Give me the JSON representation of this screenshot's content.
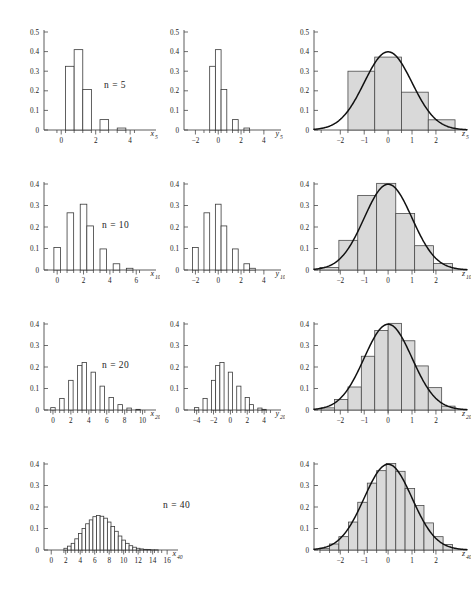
{
  "figure": {
    "title": "",
    "background": "#ffffff",
    "bar_fill_open": "#ffffff",
    "bar_fill_shaded": "#d9d9d9",
    "bar_stroke": "#3a3a3a",
    "axis_color": "#4a4a4a",
    "curve_color": "#111111"
  },
  "rows": [
    {
      "n_label_prefix": "n",
      "n_label_eq": "=",
      "n_label_value": "5"
    },
    {
      "n_label_prefix": "n",
      "n_label_eq": "=",
      "n_label_value": "10"
    },
    {
      "n_label_prefix": "n",
      "n_label_eq": "=",
      "n_label_value": "20"
    },
    {
      "n_label_prefix": "n",
      "n_label_eq": "=",
      "n_label_value": "40"
    }
  ],
  "chart_data": [
    {
      "type": "bar",
      "id": "x5",
      "row": 1,
      "column": 1,
      "title": "",
      "xlabel": "x",
      "xlabel_sub": "5",
      "ylabel": "",
      "xlim": [
        -1,
        5.5
      ],
      "ylim": [
        0,
        0.5
      ],
      "bin_width": 0.5,
      "grid": false,
      "legend": null,
      "yticks": [
        0,
        0.1,
        0.2,
        0.3,
        0.4,
        0.5
      ],
      "ytick_labels": [
        "0",
        "0.1",
        "0.2",
        "0.3",
        "0.4",
        "0.5"
      ],
      "xticks": [
        0,
        2,
        4
      ],
      "xtick_labels": [
        "0",
        "2",
        "4"
      ],
      "xtick_minor": [
        -0.5,
        0,
        0.5,
        1,
        1.5,
        2,
        2.5,
        3,
        3.5,
        4,
        4.5
      ],
      "bin_edges": [
        -0.25,
        0.25,
        0.75,
        1.25,
        1.75,
        2.25,
        2.75,
        3.25,
        3.75,
        4.25
      ],
      "values": [
        0.0,
        0.325,
        0.41,
        0.207,
        0.0,
        0.053,
        0.0,
        0.01,
        0.0
      ]
    },
    {
      "type": "bar",
      "id": "y5",
      "row": 1,
      "column": 2,
      "title": "",
      "xlabel": "y",
      "xlabel_sub": "5",
      "ylabel": "",
      "xlim": [
        -3,
        5.5
      ],
      "ylim": [
        0,
        0.5
      ],
      "bin_width": 0.5,
      "grid": false,
      "legend": null,
      "yticks": [
        0,
        0.1,
        0.2,
        0.3,
        0.4,
        0.5
      ],
      "ytick_labels": [
        "0",
        "0.1",
        "0.2",
        "0.3",
        "0.4",
        "0.5"
      ],
      "xticks": [
        -2,
        0,
        2,
        4
      ],
      "xtick_labels": [
        "−2",
        "0",
        "2",
        "4"
      ],
      "xtick_minor": [
        -1.5,
        -1,
        -0.5,
        0,
        0.5,
        1,
        1.5,
        2,
        2.5
      ],
      "bin_edges": [
        -1.25,
        -0.75,
        -0.25,
        0.25,
        0.75,
        1.25,
        1.75,
        2.25,
        2.75
      ],
      "values": [
        0.0,
        0.325,
        0.41,
        0.207,
        0.0,
        0.053,
        0.0,
        0.01
      ]
    },
    {
      "type": "bar",
      "id": "z5",
      "row": 1,
      "column": 3,
      "title": "",
      "xlabel": "z",
      "xlabel_sub": "5",
      "ylabel": "",
      "xlim": [
        -3.1,
        3.3
      ],
      "ylim": [
        0,
        0.5
      ],
      "bin_width": 1.118,
      "grid": false,
      "legend": null,
      "yticks": [
        0,
        0.1,
        0.2,
        0.3,
        0.4,
        0.5
      ],
      "ytick_labels": [
        "0",
        "0.1",
        "0.2",
        "0.3",
        "0.4",
        "0.5"
      ],
      "xticks": [
        -2,
        -1,
        0,
        1,
        2
      ],
      "xtick_labels": [
        "−2",
        "−1",
        "0",
        "1",
        "2"
      ],
      "bin_edges": [
        -2.8,
        -1.68,
        -0.56,
        0.56,
        1.68,
        2.8
      ],
      "values": [
        0.0,
        0.3,
        0.372,
        0.193,
        0.052
      ],
      "overlay_curve": {
        "name": "standard normal density",
        "formula": "phi(z) = exp(-z^2/2)/sqrt(2*pi)",
        "mean": 0,
        "sd": 1,
        "peak": 0.399
      }
    },
    {
      "type": "bar",
      "id": "x10",
      "row": 2,
      "column": 1,
      "title": "",
      "xlabel": "x",
      "xlabel_sub": "10",
      "ylabel": "",
      "xlim": [
        -1,
        7.5
      ],
      "ylim": [
        0,
        0.4
      ],
      "bin_width": 0.5,
      "grid": false,
      "legend": null,
      "yticks": [
        0,
        0.1,
        0.2,
        0.3,
        0.4
      ],
      "ytick_labels": [
        "0",
        "0.1",
        "0.2",
        "0.3",
        "0.4"
      ],
      "xticks": [
        0,
        2,
        4,
        6
      ],
      "xtick_labels": [
        "0",
        "2",
        "4",
        "6"
      ],
      "bin_edges": [
        -0.25,
        0.25,
        0.75,
        1.25,
        1.75,
        2.25,
        2.75,
        3.25,
        3.75,
        4.25,
        4.75,
        5.25,
        5.75,
        6.25
      ],
      "values": [
        0.105,
        0.0,
        0.266,
        0.0,
        0.306,
        0.205,
        0.0,
        0.098,
        0.0,
        0.029,
        0.0,
        0.008,
        0.0
      ]
    },
    {
      "type": "bar",
      "id": "y10",
      "row": 2,
      "column": 2,
      "title": "",
      "xlabel": "y",
      "xlabel_sub": "10",
      "ylabel": "",
      "xlim": [
        -3,
        5.5
      ],
      "ylim": [
        0,
        0.4
      ],
      "bin_width": 0.5,
      "grid": false,
      "legend": null,
      "yticks": [
        0,
        0.1,
        0.2,
        0.3,
        0.4
      ],
      "ytick_labels": [
        "0",
        "0.1",
        "0.2",
        "0.3",
        "0.4"
      ],
      "xticks": [
        -2,
        0,
        2,
        4
      ],
      "xtick_labels": [
        "−2",
        "0",
        "2",
        "4"
      ],
      "bin_edges": [
        -2.25,
        -1.75,
        -1.25,
        -0.75,
        -0.25,
        0.25,
        0.75,
        1.25,
        1.75,
        2.25,
        2.75,
        3.25
      ],
      "values": [
        0.105,
        0.0,
        0.266,
        0.0,
        0.306,
        0.205,
        0.0,
        0.098,
        0.0,
        0.029,
        0.008
      ]
    },
    {
      "type": "bar",
      "id": "z10",
      "row": 2,
      "column": 3,
      "title": "",
      "xlabel": "z",
      "xlabel_sub": "10",
      "ylabel": "",
      "xlim": [
        -3.1,
        3.3
      ],
      "ylim": [
        0,
        0.4
      ],
      "bin_width": 0.79,
      "grid": false,
      "legend": null,
      "yticks": [
        0,
        0.1,
        0.2,
        0.3,
        0.4
      ],
      "ytick_labels": [
        "0",
        "0.1",
        "0.2",
        "0.3",
        "0.4"
      ],
      "xticks": [
        -2,
        -1,
        0,
        1,
        2
      ],
      "xtick_labels": [
        "−2",
        "−1",
        "0",
        "1",
        "2"
      ],
      "bin_edges": [
        -2.85,
        -2.06,
        -1.27,
        -0.48,
        0.32,
        1.11,
        1.9,
        2.69
      ],
      "values": [
        0.012,
        0.138,
        0.347,
        0.403,
        0.263,
        0.113,
        0.03
      ],
      "overlay_curve": {
        "name": "standard normal density",
        "formula": "phi(z) = exp(-z^2/2)/sqrt(2*pi)",
        "mean": 0,
        "sd": 1,
        "peak": 0.399
      }
    },
    {
      "type": "bar",
      "id": "x20",
      "row": 3,
      "column": 1,
      "title": "",
      "xlabel": "x",
      "xlabel_sub": "20",
      "ylabel": "",
      "xlim": [
        -1,
        11.5
      ],
      "ylim": [
        0,
        0.4
      ],
      "bin_width": 0.5,
      "grid": false,
      "legend": null,
      "yticks": [
        0,
        0.1,
        0.2,
        0.3,
        0.4
      ],
      "ytick_labels": [
        "0",
        "0.1",
        "0.2",
        "0.3",
        "0.4"
      ],
      "xticks": [
        0,
        2,
        4,
        6,
        8,
        10
      ],
      "xtick_labels": [
        "0",
        "2",
        "4",
        "6",
        "8",
        "10"
      ],
      "bin_edges": [
        -0.25,
        0.25,
        0.75,
        1.25,
        1.75,
        2.25,
        2.75,
        3.25,
        3.75,
        4.25,
        4.75,
        5.25,
        5.75,
        6.25,
        6.75,
        7.25,
        7.75,
        8.25,
        8.75,
        9.25,
        9.75,
        10.25
      ],
      "values": [
        0.011,
        0.0,
        0.054,
        0.0,
        0.138,
        0.0,
        0.207,
        0.221,
        0.0,
        0.176,
        0.0,
        0.111,
        0.0,
        0.058,
        0.0,
        0.025,
        0.0,
        0.009,
        0.0,
        0.003,
        0.0
      ]
    },
    {
      "type": "bar",
      "id": "y20",
      "row": 3,
      "column": 2,
      "title": "",
      "xlabel": "y",
      "xlabel_sub": "20",
      "ylabel": "",
      "xlim": [
        -5.5,
        6
      ],
      "ylim": [
        0,
        0.4
      ],
      "bin_width": 0.5,
      "grid": false,
      "legend": null,
      "yticks": [
        0,
        0.1,
        0.2,
        0.3,
        0.4
      ],
      "ytick_labels": [
        "0",
        "0.1",
        "0.2",
        "0.3",
        "0.4"
      ],
      "xticks": [
        -4,
        -2,
        0,
        2,
        4
      ],
      "xtick_labels": [
        "−4",
        "−2",
        "0",
        "2",
        "4"
      ],
      "bin_edges": [
        -4.25,
        -3.75,
        -3.25,
        -2.75,
        -2.25,
        -1.75,
        -1.25,
        -0.75,
        -0.25,
        0.25,
        0.75,
        1.25,
        1.75,
        2.25,
        2.75,
        3.25,
        3.75,
        4.25,
        4.75
      ],
      "values": [
        0.011,
        0.0,
        0.054,
        0.0,
        0.138,
        0.207,
        0.221,
        0.0,
        0.176,
        0.0,
        0.111,
        0.0,
        0.058,
        0.025,
        0.0,
        0.009,
        0.003,
        0.0
      ]
    },
    {
      "type": "bar",
      "id": "z20",
      "row": 3,
      "column": 3,
      "title": "",
      "xlabel": "z",
      "xlabel_sub": "20",
      "ylabel": "",
      "xlim": [
        -3.1,
        3.3
      ],
      "ylim": [
        0,
        0.4
      ],
      "bin_width": 0.559,
      "grid": false,
      "legend": null,
      "yticks": [
        0,
        0.1,
        0.2,
        0.3,
        0.4
      ],
      "ytick_labels": [
        "0",
        "0.1",
        "0.2",
        "0.3",
        "0.4"
      ],
      "xticks": [
        -2,
        -1,
        0,
        1,
        2
      ],
      "xtick_labels": [
        "−2",
        "−1",
        "0",
        "1",
        "2"
      ],
      "bin_edges": [
        -2.8,
        -2.24,
        -1.68,
        -1.12,
        -0.56,
        0.0,
        0.56,
        1.12,
        1.68,
        2.24,
        2.8
      ],
      "values": [
        0.01,
        0.049,
        0.107,
        0.25,
        0.37,
        0.403,
        0.322,
        0.205,
        0.104,
        0.018
      ],
      "overlay_curve": {
        "name": "standard normal density",
        "formula": "phi(z) = exp(-z^2/2)/sqrt(2*pi)",
        "mean": 0,
        "sd": 1,
        "peak": 0.399
      }
    },
    {
      "type": "bar",
      "id": "x40",
      "row": 4,
      "column": 1,
      "title": "",
      "xlabel": "x",
      "xlabel_sub": "40",
      "ylabel": "",
      "xlim": [
        -1,
        17.5
      ],
      "ylim": [
        0,
        0.4
      ],
      "bin_width": 0.5,
      "grid": false,
      "legend": null,
      "yticks": [
        0,
        0.1,
        0.2,
        0.3,
        0.4
      ],
      "ytick_labels": [
        "0",
        "0.1",
        "0.2",
        "0.3",
        "0.4"
      ],
      "xticks": [
        0,
        2,
        4,
        6,
        8,
        10,
        12,
        14,
        16
      ],
      "xtick_labels": [
        "0",
        "2",
        "4",
        "6",
        "8",
        "10",
        "12",
        "14",
        "16"
      ],
      "bin_edges": [
        1.75,
        2.25,
        2.75,
        3.25,
        3.75,
        4.25,
        4.75,
        5.25,
        5.75,
        6.25,
        6.75,
        7.25,
        7.75,
        8.25,
        8.75,
        9.25,
        9.75,
        10.25,
        10.75,
        11.25,
        11.75,
        12.25,
        12.75,
        13.25,
        13.75,
        14.25,
        14.75,
        15.25
      ],
      "values": [
        0.008,
        0.018,
        0.031,
        0.052,
        0.077,
        0.1,
        0.122,
        0.14,
        0.155,
        0.16,
        0.157,
        0.148,
        0.13,
        0.109,
        0.087,
        0.065,
        0.046,
        0.031,
        0.02,
        0.013,
        0.008,
        0.005,
        0.003,
        0.002,
        0.001,
        0.001,
        0.0
      ]
    },
    {
      "type": "bar",
      "id": "z40",
      "row": 4,
      "column": 3,
      "title": "",
      "xlabel": "z",
      "xlabel_sub": "40",
      "ylabel": "",
      "xlim": [
        -3.1,
        3.3
      ],
      "ylim": [
        0,
        0.4
      ],
      "bin_width": 0.395,
      "grid": false,
      "legend": null,
      "yticks": [
        0,
        0.1,
        0.2,
        0.3,
        0.4
      ],
      "ytick_labels": [
        "0",
        "0.1",
        "0.2",
        "0.3",
        "0.4"
      ],
      "xticks": [
        -2,
        -1,
        0,
        1,
        2
      ],
      "xtick_labels": [
        "−2",
        "−1",
        "0",
        "1",
        "2"
      ],
      "bin_edges": [
        -2.85,
        -2.45,
        -2.06,
        -1.66,
        -1.27,
        -0.87,
        -0.48,
        -0.08,
        0.32,
        0.71,
        1.11,
        1.5,
        1.9,
        2.3,
        2.69
      ],
      "values": [
        0.008,
        0.028,
        0.062,
        0.13,
        0.222,
        0.311,
        0.369,
        0.402,
        0.366,
        0.286,
        0.207,
        0.126,
        0.062,
        0.026
      ],
      "overlay_curve": {
        "name": "standard normal density",
        "formula": "phi(z) = exp(-z^2/2)/sqrt(2*pi)",
        "mean": 0,
        "sd": 1,
        "peak": 0.399
      }
    }
  ]
}
